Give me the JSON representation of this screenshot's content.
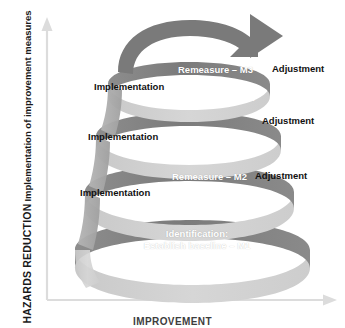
{
  "axes": {
    "y_title": "HAZARDS REDUCTION",
    "y_subtitle": "Implementation of improvement measures",
    "x_title": "IMPROVEMENT",
    "y_arrow_icon": "arrow-up-icon",
    "x_arrow_icon": "arrow-right-icon",
    "axis_color": "#d9d9d9"
  },
  "colors": {
    "band_dark": "#808080",
    "band_light": "#d2d2d2",
    "band_mid": "#a6a6a6",
    "arrow_gray": "#7a7a7a",
    "text_light": "#ffffff",
    "text_dark": "#111111"
  },
  "top_arrow": {
    "icon": "curved-arrow-right-icon",
    "label": ""
  },
  "cycles": [
    {
      "id": "cycle-3",
      "remeasure": "Remeasure – M3",
      "adjustment": "Adjustment",
      "implementation": "Implementation",
      "learning": "Learning & reflection"
    },
    {
      "id": "cycle-2b",
      "remeasure": "",
      "adjustment": "Adjustment",
      "implementation": "Implementation",
      "learning": "Learning & reflection"
    },
    {
      "id": "cycle-2",
      "remeasure": "Remeasure – M2",
      "adjustment": "Adjustment",
      "implementation": "Implementation",
      "learning": "Learning & reflection"
    },
    {
      "id": "cycle-1",
      "identification_line1": "Identification:",
      "identification_line2": "Establish baseline – M1"
    }
  ]
}
